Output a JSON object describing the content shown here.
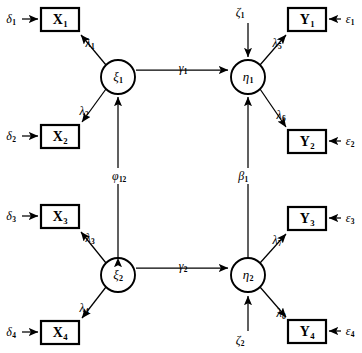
{
  "diagram": {
    "type": "structural-equation-model-path-diagram",
    "title": "",
    "background_color": "#ffffff",
    "stroke_color": "#000000",
    "latent_variables": [
      {
        "id": "xi1",
        "label": "ξ",
        "subscript": "1",
        "shape": "circle",
        "cx": 118,
        "cy": 77,
        "r": 17
      },
      {
        "id": "xi2",
        "label": "ξ",
        "subscript": "2",
        "shape": "circle",
        "cx": 118,
        "cy": 275,
        "r": 17
      },
      {
        "id": "eta1",
        "label": "η",
        "subscript": "1",
        "shape": "circle",
        "cx": 248,
        "cy": 77,
        "r": 17
      },
      {
        "id": "eta2",
        "label": "η",
        "subscript": "2",
        "shape": "circle",
        "cx": 248,
        "cy": 275,
        "r": 17
      }
    ],
    "observed_variables": [
      {
        "id": "X1",
        "label": "X",
        "subscript": "1",
        "shape": "rect",
        "x": 41,
        "y": 8,
        "w": 38,
        "h": 23
      },
      {
        "id": "X2",
        "label": "X",
        "subscript": "2",
        "shape": "rect",
        "x": 41,
        "y": 125,
        "w": 38,
        "h": 23
      },
      {
        "id": "X3",
        "label": "X",
        "subscript": "3",
        "shape": "rect",
        "x": 41,
        "y": 205,
        "w": 38,
        "h": 23
      },
      {
        "id": "X4",
        "label": "X",
        "subscript": "4",
        "shape": "rect",
        "x": 41,
        "y": 321,
        "w": 38,
        "h": 23
      },
      {
        "id": "Y1",
        "label": "Y",
        "subscript": "1",
        "shape": "rect",
        "x": 288,
        "y": 8,
        "w": 38,
        "h": 23
      },
      {
        "id": "Y2",
        "label": "Y",
        "subscript": "2",
        "shape": "rect",
        "x": 288,
        "y": 130,
        "w": 38,
        "h": 23
      },
      {
        "id": "Y3",
        "label": "Y",
        "subscript": "3",
        "shape": "rect",
        "x": 288,
        "y": 207,
        "w": 38,
        "h": 23
      },
      {
        "id": "Y4",
        "label": "Y",
        "subscript": "4",
        "shape": "rect",
        "x": 288,
        "y": 320,
        "w": 38,
        "h": 23
      }
    ],
    "error_terms": [
      {
        "id": "delta1",
        "label": "δ",
        "subscript": "1",
        "x": 11,
        "y": 19,
        "target": "X1"
      },
      {
        "id": "delta2",
        "label": "δ",
        "subscript": "2",
        "x": 11,
        "y": 136,
        "target": "X2"
      },
      {
        "id": "delta3",
        "label": "δ",
        "subscript": "3",
        "x": 11,
        "y": 216,
        "target": "X3"
      },
      {
        "id": "delta4",
        "label": "δ",
        "subscript": "4",
        "x": 11,
        "y": 332,
        "target": "X4"
      },
      {
        "id": "epsilon1",
        "label": "ε",
        "subscript": "1",
        "x": 347,
        "y": 19,
        "target": "Y1"
      },
      {
        "id": "epsilon2",
        "label": "ε",
        "subscript": "2",
        "x": 347,
        "y": 141,
        "target": "Y2"
      },
      {
        "id": "epsilon3",
        "label": "ε",
        "subscript": "3",
        "x": 347,
        "y": 218,
        "target": "Y3"
      },
      {
        "id": "epsilon4",
        "label": "ε",
        "subscript": "4",
        "x": 347,
        "y": 331,
        "target": "Y4"
      }
    ],
    "disturbances": [
      {
        "id": "zeta1",
        "label": "ζ",
        "subscript": "1",
        "x": 240,
        "y": 12,
        "target": "eta1"
      },
      {
        "id": "zeta2",
        "label": "ζ",
        "subscript": "2",
        "x": 240,
        "y": 338,
        "target": "eta2"
      }
    ],
    "path_labels": [
      {
        "id": "lambda1",
        "label": "λ",
        "subscript": "1",
        "x": 90,
        "y": 43,
        "from": "xi1",
        "to": "X1"
      },
      {
        "id": "lambda2",
        "label": "λ",
        "subscript": "2",
        "x": 84,
        "y": 111,
        "from": "xi1",
        "to": "X2"
      },
      {
        "id": "lambda3",
        "label": "λ",
        "subscript": "3",
        "x": 90,
        "y": 238,
        "from": "xi2",
        "to": "X3"
      },
      {
        "id": "lambda4",
        "label": "λ",
        "subscript": "4",
        "x": 84,
        "y": 308,
        "from": "xi2",
        "to": "X4"
      },
      {
        "id": "lambda5",
        "label": "λ",
        "subscript": "5",
        "x": 277,
        "y": 43,
        "from": "eta1",
        "to": "Y1"
      },
      {
        "id": "lambda6",
        "label": "λ",
        "subscript": "6",
        "x": 281,
        "y": 115,
        "from": "eta1",
        "to": "Y2"
      },
      {
        "id": "lambda7",
        "label": "λ",
        "subscript": "7",
        "x": 277,
        "y": 240,
        "from": "eta2",
        "to": "Y3"
      },
      {
        "id": "lambda8",
        "label": "λ",
        "subscript": "8",
        "x": 281,
        "y": 313,
        "from": "eta2",
        "to": "Y4"
      },
      {
        "id": "gamma1",
        "label": "γ",
        "subscript": "1",
        "x": 183,
        "y": 68,
        "from": "xi1",
        "to": "eta1"
      },
      {
        "id": "gamma2",
        "label": "γ",
        "subscript": "2",
        "x": 183,
        "y": 266,
        "from": "xi2",
        "to": "eta2"
      },
      {
        "id": "phi12",
        "label": "φ",
        "subscript": "12",
        "x": 119,
        "y": 176,
        "from": "xi2",
        "to": "xi1"
      },
      {
        "id": "beta1",
        "label": "β",
        "subscript": "1",
        "x": 243,
        "y": 176,
        "from": "eta2",
        "to": "eta1"
      }
    ]
  }
}
